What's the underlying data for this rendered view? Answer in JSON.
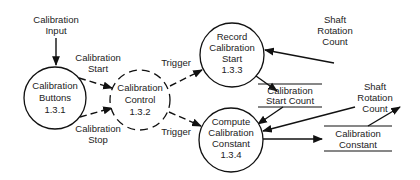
{
  "diagram": {
    "type": "data-flow-diagram",
    "colors": {
      "line": "#111111",
      "text": "#222222",
      "background": "#ffffff"
    },
    "processes": [
      {
        "id": "p131",
        "label_lines": [
          "Calibration",
          "Buttons",
          "1.3.1"
        ],
        "number": "1.3.1",
        "style": "solid",
        "cx": 55,
        "cy": 98,
        "r": 31
      },
      {
        "id": "p132",
        "label_lines": [
          "Calibration",
          "Control",
          "1.3.2"
        ],
        "number": "1.3.2",
        "style": "dashed",
        "cx": 140,
        "cy": 100,
        "r": 30
      },
      {
        "id": "p133",
        "label_lines": [
          "Record",
          "Calibration",
          "Start",
          "1.3.3"
        ],
        "number": "1.3.3",
        "style": "solid",
        "cx": 232,
        "cy": 55,
        "r": 32
      },
      {
        "id": "p134",
        "label_lines": [
          "Compute",
          "Calibration",
          "Constant",
          "1.3.4"
        ],
        "number": "1.3.4",
        "style": "solid",
        "cx": 231,
        "cy": 140,
        "r": 32
      }
    ],
    "data_stores": [
      {
        "id": "ds1",
        "label_lines": [
          "Calibration",
          "Start Count"
        ],
        "x1": 258,
        "x2": 322,
        "y_top": 84,
        "y_bottom": 107
      },
      {
        "id": "ds2",
        "label_lines": [
          "Calibration",
          "Constant"
        ],
        "x1": 324,
        "x2": 392,
        "y_top": 126,
        "y_bottom": 151
      }
    ],
    "flows": [
      {
        "id": "f1",
        "label_lines": [
          "Calibration",
          "Input"
        ],
        "from": "external",
        "to": "p131",
        "style": "solid"
      },
      {
        "id": "f2",
        "label_lines": [
          "Calibration",
          "Start"
        ],
        "from": "p131",
        "to": "p132",
        "style": "dashed"
      },
      {
        "id": "f3",
        "label_lines": [
          "Calibration",
          "Stop"
        ],
        "from": "p131",
        "to": "p132",
        "style": "dashed"
      },
      {
        "id": "f4",
        "label_lines": [
          "Trigger"
        ],
        "from": "p132",
        "to": "p133",
        "style": "dashed"
      },
      {
        "id": "f5",
        "label_lines": [
          "Trigger"
        ],
        "from": "p132",
        "to": "p134",
        "style": "dashed"
      },
      {
        "id": "f6",
        "label_lines": [
          "Shaft",
          "Rotation",
          "Count"
        ],
        "from": "external",
        "to": "p133",
        "style": "solid"
      },
      {
        "id": "f7",
        "label_lines": [],
        "from": "p133",
        "to": "ds1",
        "style": "solid"
      },
      {
        "id": "f8",
        "label_lines": [],
        "from": "ds1",
        "to": "p134",
        "style": "solid"
      },
      {
        "id": "f9",
        "label_lines": [],
        "from": "external",
        "to": "p134",
        "style": "solid"
      },
      {
        "id": "f10",
        "label_lines": [],
        "from": "p134",
        "to": "ds2",
        "style": "solid"
      },
      {
        "id": "f11",
        "label_lines": [
          "Shaft",
          "Rotation",
          "Count"
        ],
        "from": "ds2",
        "to": "external",
        "style": "solid"
      }
    ]
  },
  "labels": {
    "cal_input_1": "Calibration",
    "cal_input_2": "Input",
    "cal_start_1": "Calibration",
    "cal_start_2": "Start",
    "cal_stop_1": "Calibration",
    "cal_stop_2": "Stop",
    "trigger_top": "Trigger",
    "trigger_bottom": "Trigger",
    "shaft_top_1": "Shaft",
    "shaft_top_2": "Rotation",
    "shaft_top_3": "Count",
    "shaft_right_1": "Shaft",
    "shaft_right_2": "Rotation",
    "shaft_right_3": "Count",
    "p131_1": "Calibration",
    "p131_2": "Buttons",
    "p131_3": "1.3.1",
    "p132_1": "Calibration",
    "p132_2": "Control",
    "p132_3": "1.3.2",
    "p133_1": "Record",
    "p133_2": "Calibration",
    "p133_3": "Start",
    "p133_4": "1.3.3",
    "p134_1": "Compute",
    "p134_2": "Calibration",
    "p134_3": "Constant",
    "p134_4": "1.3.4",
    "ds1_1": "Calibration",
    "ds1_2": "Start Count",
    "ds2_1": "Calibration",
    "ds2_2": "Constant"
  }
}
